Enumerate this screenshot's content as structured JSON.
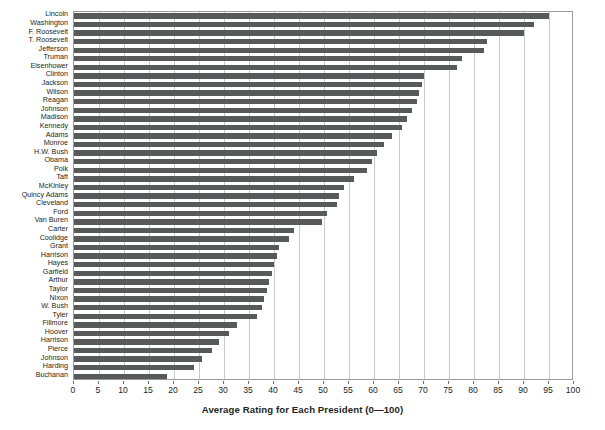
{
  "clipped_header_text": "",
  "chart_data": {
    "type": "bar",
    "orientation": "horizontal",
    "title": "",
    "xlabel": "Average Rating for Each President (0—100)",
    "ylabel": "",
    "xlim": [
      0,
      100
    ],
    "xticks": [
      0,
      5,
      10,
      15,
      20,
      25,
      30,
      35,
      40,
      45,
      50,
      55,
      60,
      65,
      70,
      75,
      80,
      85,
      90,
      95,
      100
    ],
    "grid": "vertical",
    "legend": "none",
    "bar_color": "#58595b",
    "categories": [
      "Lincoln",
      "Washington",
      "F. Roosevelt",
      "T. Roosevelt",
      "Jefferson",
      "Truman",
      "Eisenhower",
      "Clinton",
      "Jackson",
      "Wilson",
      "Reagan",
      "Johnson",
      "Madison",
      "Kennedy",
      "Adams",
      "Monroe",
      "H.W. Bush",
      "Obama",
      "Polk",
      "Taft",
      "McKinley",
      "Quincy Adams",
      "Cleveland",
      "Ford",
      "Van Buren",
      "Carter",
      "Coolidge",
      "Grant",
      "Harrison",
      "Hayes",
      "Garfield",
      "Arthur",
      "Taylor",
      "Nixon",
      "W. Bush",
      "Tyler",
      "Fillmore",
      "Hoover",
      "Harrison",
      "Pierce",
      "Johnson",
      "Harding",
      "Buchanan"
    ],
    "values": [
      95.0,
      92.0,
      90.0,
      82.5,
      82.0,
      77.5,
      76.5,
      70.0,
      69.5,
      69.0,
      68.5,
      67.5,
      66.5,
      65.5,
      63.5,
      62.0,
      60.5,
      59.5,
      58.5,
      56.0,
      54.0,
      53.0,
      52.5,
      50.5,
      49.5,
      44.0,
      43.0,
      41.0,
      40.5,
      40.0,
      39.5,
      39.0,
      38.5,
      38.0,
      37.5,
      36.5,
      32.5,
      31.0,
      29.0,
      27.5,
      25.5,
      24.0,
      18.5
    ],
    "ylabel_unit": "President"
  }
}
